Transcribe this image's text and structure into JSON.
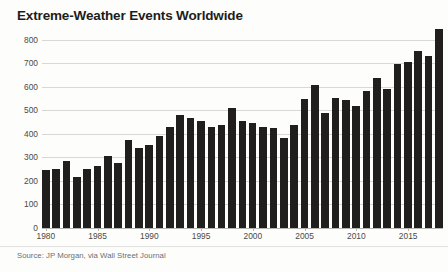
{
  "chart_data": {
    "type": "bar",
    "title": "Extreme-Weather Events Worldwide",
    "subtitle": "",
    "source": "Source: JP Morgan, via Wall Street Journal",
    "xlabel": "",
    "ylabel": "",
    "ylim": [
      0,
      850
    ],
    "yticks": [
      0,
      100,
      200,
      300,
      400,
      500,
      600,
      700,
      800
    ],
    "ytick_labels": [
      "0",
      "100",
      "200",
      "300",
      "400",
      "500",
      "600",
      "700",
      "800"
    ],
    "xtick_labels": [
      "1980",
      "1985",
      "1990",
      "1995",
      "2000",
      "2005",
      "2010",
      "2015"
    ],
    "xtick_years": [
      1980,
      1985,
      1990,
      1995,
      2000,
      2005,
      2010,
      2015
    ],
    "grid": true,
    "legend": false,
    "bar_color": "#201f1d",
    "grid_color": "#d8d8d6",
    "categories": [
      "1980",
      "1981",
      "1982",
      "1983",
      "1984",
      "1985",
      "1986",
      "1987",
      "1988",
      "1989",
      "1990",
      "1991",
      "1992",
      "1993",
      "1994",
      "1995",
      "1996",
      "1997",
      "1998",
      "1999",
      "2000",
      "2001",
      "2002",
      "2003",
      "2004",
      "2005",
      "2006",
      "2007",
      "2008",
      "2009",
      "2010",
      "2011",
      "2012",
      "2013",
      "2014",
      "2015",
      "2016",
      "2017",
      "2018"
    ],
    "values": [
      245,
      250,
      285,
      215,
      250,
      265,
      305,
      275,
      375,
      340,
      355,
      390,
      430,
      480,
      470,
      455,
      430,
      440,
      510,
      455,
      445,
      430,
      425,
      385,
      440,
      550,
      610,
      490,
      555,
      545,
      520,
      585,
      640,
      590,
      700,
      705,
      755,
      730,
      845
    ],
    "series_name": "Extreme-weather events"
  }
}
